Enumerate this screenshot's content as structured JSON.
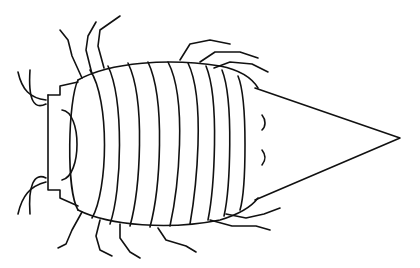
{
  "image": {
    "subject": "isopod line drawing",
    "background": "#ffffff",
    "stroke": "#111111"
  }
}
